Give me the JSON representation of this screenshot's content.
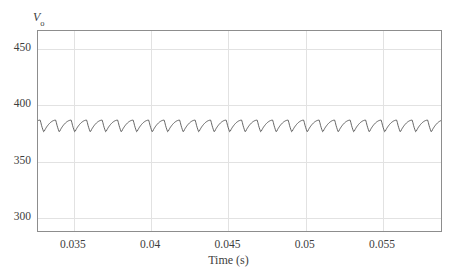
{
  "chart_data": {
    "type": "line",
    "title": "",
    "xlabel": "Time (s)",
    "ylabel": "V_o",
    "ylabel_base": "V",
    "ylabel_sub": "o",
    "xlim": [
      0.03268,
      0.05888
    ],
    "ylim": [
      287.0,
      465.5
    ],
    "grid": true,
    "legend": null,
    "trace_color": "#555555",
    "grid_color": "#e2e2e2",
    "frame_color": "#8d8d8d",
    "background_color": "#ffffff",
    "xticks": [
      {
        "value": 0.035,
        "label": "0.035"
      },
      {
        "value": 0.04,
        "label": "0.04"
      },
      {
        "value": 0.045,
        "label": "0.045"
      },
      {
        "value": 0.05,
        "label": "0.05"
      },
      {
        "value": 0.055,
        "label": "0.055"
      }
    ],
    "yticks": [
      {
        "value": 450,
        "label": "450"
      },
      {
        "value": 400,
        "label": "400"
      },
      {
        "value": 350,
        "label": "350"
      },
      {
        "value": 300,
        "label": "300"
      }
    ],
    "ripple": {
      "cycles": 26,
      "period_s": 0.001007,
      "peak_value": 386.0,
      "trough_value": 375.0,
      "mean_value": 381.0,
      "ripple_pp": 11.0,
      "first_peak_time": 0.0329
    },
    "series": [
      {
        "name": "Vo",
        "x": [
          0.03268,
          0.0329,
          0.03318,
          0.03346,
          0.03368,
          0.033907,
          0.034187,
          0.034467,
          0.034687,
          0.034914,
          0.035194,
          0.035474,
          0.035694,
          0.035921,
          0.036201,
          0.036481,
          0.036701,
          0.036928,
          0.037208,
          0.037488,
          0.037708,
          0.037935,
          0.038215,
          0.038495,
          0.038715,
          0.038942,
          0.039222,
          0.039502,
          0.039722,
          0.039949,
          0.040229,
          0.040509,
          0.040729,
          0.040956,
          0.041236,
          0.041516,
          0.041736,
          0.041963,
          0.042243,
          0.042523,
          0.042743,
          0.04297,
          0.04325,
          0.04353,
          0.04375,
          0.043977,
          0.044257,
          0.044537,
          0.044757,
          0.044984,
          0.045264,
          0.045544,
          0.045764,
          0.045991,
          0.046271,
          0.046551,
          0.046771,
          0.046998,
          0.047278,
          0.047558,
          0.047778,
          0.048005,
          0.048285,
          0.048565,
          0.048785,
          0.049012,
          0.049292,
          0.049572,
          0.049792,
          0.050019,
          0.050299,
          0.050579,
          0.050799,
          0.051026,
          0.051306,
          0.051586,
          0.051806,
          0.052033,
          0.052313,
          0.052593,
          0.052813,
          0.05304,
          0.05332,
          0.0536,
          0.05382,
          0.054047,
          0.054327,
          0.054607,
          0.054827,
          0.055054,
          0.055334,
          0.055614,
          0.055834,
          0.056061,
          0.056341,
          0.056621,
          0.056841,
          0.057068,
          0.057348,
          0.057628,
          0.057848,
          0.058075,
          0.058355,
          0.058635,
          0.05888
        ],
        "y": [
          381.5,
          386.0,
          379.5,
          375.0,
          381.5,
          386.0,
          379.5,
          375.0,
          381.5,
          386.0,
          379.5,
          375.0,
          381.5,
          386.0,
          379.5,
          375.0,
          381.5,
          386.0,
          379.5,
          375.0,
          381.5,
          386.0,
          379.5,
          375.0,
          381.5,
          386.0,
          379.5,
          375.0,
          381.5,
          386.0,
          379.5,
          375.0,
          381.5,
          386.0,
          379.5,
          375.0,
          381.5,
          386.0,
          379.5,
          375.0,
          381.5,
          386.0,
          379.5,
          375.0,
          381.5,
          386.0,
          379.5,
          375.0,
          381.5,
          386.0,
          379.5,
          375.0,
          381.5,
          386.0,
          379.5,
          375.0,
          381.5,
          386.0,
          379.5,
          375.0,
          381.5,
          386.0,
          379.5,
          375.0,
          381.5,
          386.0,
          379.5,
          375.0,
          381.5,
          386.0,
          379.5,
          375.0,
          381.5,
          386.0,
          379.5,
          375.0,
          381.5,
          386.0,
          379.5,
          375.0,
          381.5,
          386.0,
          379.5,
          375.0,
          381.5,
          386.0,
          379.5,
          375.0,
          381.5,
          386.0,
          379.5,
          375.0,
          381.5,
          386.0,
          379.5,
          375.0,
          381.5,
          386.0,
          379.5,
          375.0,
          381.5,
          386.0,
          379.5,
          375.0,
          381.0
        ]
      }
    ]
  }
}
